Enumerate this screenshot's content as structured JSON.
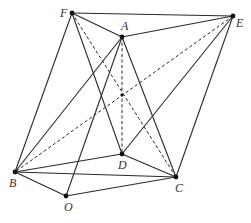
{
  "figure": {
    "type": "geometry-diagram",
    "width": 251,
    "height": 223,
    "stroke_color": "#2a2a2a",
    "point_color": "#111111",
    "label_color": "#333333"
  },
  "points": [
    {
      "id": "F",
      "x": 72,
      "y": 13,
      "label": "F",
      "lx": 60,
      "ly": 17,
      "dot": true
    },
    {
      "id": "A",
      "x": 122,
      "y": 37,
      "label": "A",
      "lx": 121,
      "ly": 30,
      "dot": true
    },
    {
      "id": "E",
      "x": 233,
      "y": 16,
      "label": "E",
      "lx": 236,
      "ly": 27,
      "dot": true
    },
    {
      "id": "B",
      "x": 15,
      "y": 172,
      "label": "B",
      "lx": 9,
      "ly": 187,
      "dot": true
    },
    {
      "id": "O",
      "x": 66,
      "y": 196,
      "label": "O",
      "lx": 64,
      "ly": 211,
      "dot": true
    },
    {
      "id": "D",
      "x": 122,
      "y": 154,
      "label": "D",
      "lx": 118,
      "ly": 169,
      "dot": true
    },
    {
      "id": "C",
      "x": 176,
      "y": 177,
      "label": "C",
      "lx": 175,
      "ly": 192,
      "dot": true
    },
    {
      "id": "X",
      "x": 122,
      "y": 95,
      "label": "",
      "lx": 0,
      "ly": 0,
      "dot": true,
      "small": true
    }
  ],
  "edges": [
    {
      "from": "F",
      "to": "E",
      "style": "solid"
    },
    {
      "from": "F",
      "to": "A",
      "style": "solid"
    },
    {
      "from": "A",
      "to": "E",
      "style": "solid"
    },
    {
      "from": "F",
      "to": "B",
      "style": "solid"
    },
    {
      "from": "F",
      "to": "D",
      "style": "solid"
    },
    {
      "from": "F",
      "to": "C",
      "style": "dashed"
    },
    {
      "from": "A",
      "to": "B",
      "style": "solid"
    },
    {
      "from": "A",
      "to": "O",
      "style": "solid"
    },
    {
      "from": "A",
      "to": "D",
      "style": "dashed"
    },
    {
      "from": "A",
      "to": "C",
      "style": "solid"
    },
    {
      "from": "E",
      "to": "B",
      "style": "dashed"
    },
    {
      "from": "E",
      "to": "D",
      "style": "solid"
    },
    {
      "from": "E",
      "to": "C",
      "style": "solid"
    },
    {
      "from": "B",
      "to": "D",
      "style": "solid"
    },
    {
      "from": "B",
      "to": "C",
      "style": "solid"
    },
    {
      "from": "B",
      "to": "O",
      "style": "solid"
    },
    {
      "from": "O",
      "to": "C",
      "style": "solid"
    },
    {
      "from": "D",
      "to": "C",
      "style": "solid"
    }
  ]
}
